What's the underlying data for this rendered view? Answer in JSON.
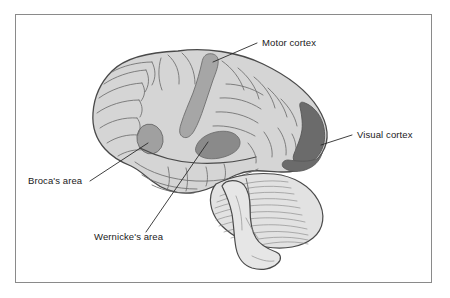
{
  "figure": {
    "frame": {
      "border_color": "#8a8a8a",
      "background": "#ffffff"
    }
  },
  "palette": {
    "cortex_fill": "#d5d5d5",
    "cortex_fill_light": "#dedede",
    "outline": "#4a4a4a",
    "sulci_line": "#6e6e6e",
    "motor_cortex_fill": "#a6a6a6",
    "brocas_area_fill": "#a0a0a0",
    "wernickes_area_fill": "#8a8a8a",
    "visual_cortex_fill": "#6b6b6b",
    "cerebellum_fill": "#e2e2e2",
    "brainstem_fill": "#e6e6e6",
    "label_color": "#1a1a1a",
    "leader_line_color": "#2a2a2a"
  },
  "labels": [
    {
      "id": "motor-cortex",
      "text": "Motor cortex",
      "text_x": 262,
      "text_y": 46,
      "anchor": "start",
      "leader": {
        "x1": 257,
        "y1": 43,
        "x2": 213,
        "y2": 62
      }
    },
    {
      "id": "visual-cortex",
      "text": "Visual cortex",
      "text_x": 357,
      "text_y": 138,
      "anchor": "start",
      "leader": {
        "x1": 352,
        "y1": 135,
        "x2": 321,
        "y2": 145
      }
    },
    {
      "id": "brocas-area",
      "text": "Broca's area",
      "text_x": 28,
      "text_y": 184,
      "anchor": "start",
      "leader": {
        "x1": 90,
        "y1": 181,
        "x2": 148,
        "y2": 143
      }
    },
    {
      "id": "wernickes-area",
      "text": "Wernicke's area",
      "text_x": 94,
      "text_y": 240,
      "anchor": "start",
      "leader": {
        "x1": 146,
        "y1": 232,
        "x2": 208,
        "y2": 142
      }
    }
  ],
  "regions": [
    {
      "id": "motor-cortex",
      "name": "Motor cortex",
      "shade": "#a6a6a6"
    },
    {
      "id": "brocas-area",
      "name": "Broca's area",
      "shade": "#a0a0a0"
    },
    {
      "id": "wernickes-area",
      "name": "Wernicke's area",
      "shade": "#8a8a8a"
    },
    {
      "id": "visual-cortex",
      "name": "Visual cortex",
      "shade": "#6b6b6b"
    }
  ],
  "structures": [
    {
      "id": "cerebrum",
      "name": "Cerebrum"
    },
    {
      "id": "cerebellum",
      "name": "Cerebellum"
    },
    {
      "id": "brainstem",
      "name": "Brainstem"
    }
  ]
}
